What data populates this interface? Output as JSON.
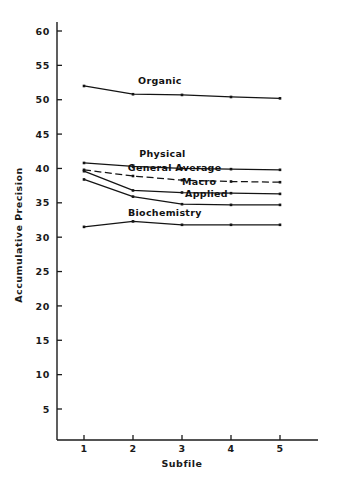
{
  "chart_data": {
    "type": "line",
    "title": "",
    "xlabel": "Subfile",
    "ylabel": "Accumulative Precision",
    "x": [
      1,
      2,
      3,
      4,
      5
    ],
    "xticklabels": [
      "1",
      "2",
      "3",
      "4",
      "5"
    ],
    "yticks": [
      5,
      10,
      15,
      20,
      25,
      30,
      35,
      40,
      45,
      50,
      55,
      60
    ],
    "yticklabels": [
      "5",
      "10",
      "15",
      "20",
      "25",
      "30",
      "35",
      "40",
      "45",
      "50",
      "55",
      "60"
    ],
    "xlim": [
      0.55,
      5.6
    ],
    "ylim": [
      0,
      62
    ],
    "grid": false,
    "legend": "inline-labels",
    "series": [
      {
        "name": "Organic",
        "label": "Organic",
        "linestyle": "solid",
        "color": "#141414",
        "values": [
          52.0,
          50.8,
          50.7,
          50.4,
          50.2
        ],
        "label_x": 2.55,
        "label_y": 52.3
      },
      {
        "name": "Physical",
        "label": "Physical",
        "linestyle": "solid",
        "color": "#141414",
        "values": [
          40.8,
          40.3,
          40.0,
          39.9,
          39.8
        ],
        "label_x": 2.6,
        "label_y": 41.6
      },
      {
        "name": "General Average",
        "label": "General Average",
        "linestyle": "dashed",
        "color": "#141414",
        "values": [
          39.8,
          38.9,
          38.3,
          38.1,
          38.0
        ],
        "label_x": 2.85,
        "label_y": 39.7
      },
      {
        "name": "Macro",
        "label": "Macro",
        "linestyle": "solid",
        "color": "#141414",
        "values": [
          39.6,
          36.8,
          36.5,
          36.4,
          36.3
        ],
        "label_x": 3.35,
        "label_y": 37.6
      },
      {
        "name": "Applied",
        "label": "Applied",
        "linestyle": "solid",
        "color": "#141414",
        "values": [
          38.4,
          35.9,
          34.8,
          34.7,
          34.7
        ],
        "label_x": 3.5,
        "label_y": 35.9
      },
      {
        "name": "Biochemistry",
        "label": "Biochemistry",
        "linestyle": "solid",
        "color": "#141414",
        "values": [
          31.5,
          32.3,
          31.8,
          31.8,
          31.8
        ],
        "label_x": 2.65,
        "label_y": 33.1
      }
    ]
  }
}
